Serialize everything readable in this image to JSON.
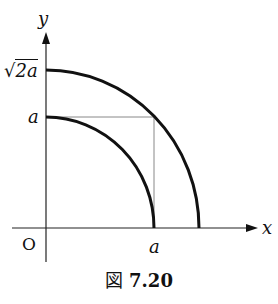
{
  "figure": {
    "caption_prefix": "図",
    "caption_number": "7.20",
    "axis_x_label": "x",
    "axis_y_label": "y",
    "origin_label": "O",
    "x_tick_label": "a",
    "y_tick_inner": "a",
    "y_tick_outer_radical": "√",
    "y_tick_outer_body": "2a"
  },
  "colors": {
    "curve": "#111111",
    "axis": "#222222",
    "guide": "#888888"
  }
}
